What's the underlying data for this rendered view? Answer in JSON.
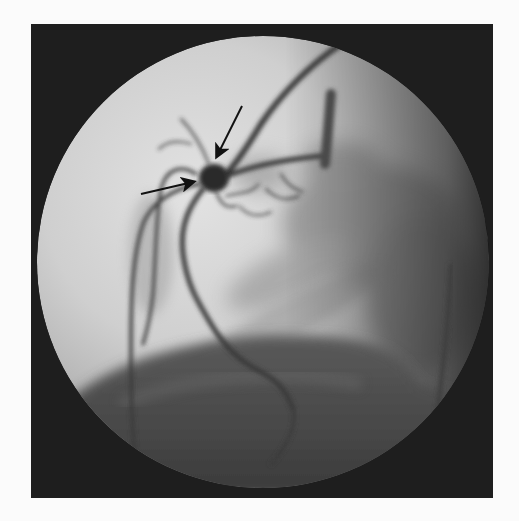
{
  "image": {
    "kind": "coronary angiogram (fluoroscopy)",
    "description": "Circular fluoroscopic field showing contrast-filled coronary arteries with a round saccular dilation (aneurysm) at a branch point, indicated by two black arrows.",
    "colors": {
      "page_background": "#fbfbfb",
      "frame_background": "#1e1e1e",
      "field_light": "#d9d9d9",
      "field_mid": "#9a9a9a",
      "diaphragm_shadow": "#4a4a4a",
      "vessel": "#3a3a3a",
      "aneurysm": "#2a2a2a",
      "arrow": "#111111"
    }
  },
  "annotations": {
    "arrows": [
      {
        "name": "arrow-down-pointing-to-aneurysm",
        "from": [
          211,
          82
        ],
        "to": [
          185,
          135
        ]
      },
      {
        "name": "arrow-right-pointing-to-aneurysm",
        "from": [
          110,
          170
        ],
        "to": [
          165,
          158
        ]
      }
    ],
    "aneurysm": {
      "center": [
        183,
        154
      ],
      "rx": 15,
      "ry": 14
    }
  }
}
